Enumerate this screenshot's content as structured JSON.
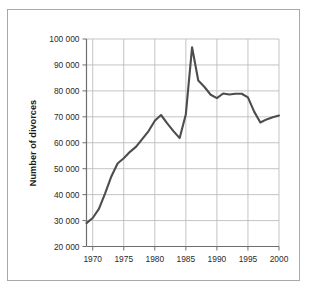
{
  "chart_data": {
    "type": "line",
    "title": "",
    "subtitle": "",
    "xlabel": "",
    "ylabel": "Number of divorces",
    "xlim": [
      1969,
      2000
    ],
    "ylim": [
      20000,
      100000
    ],
    "grid": true,
    "legend": null,
    "legend_position": "none",
    "line_color": "#4d4d4d",
    "grid_color": "#b9b9b9",
    "axis_color": "#6e6e6e",
    "frame_color": "#a8a8a8",
    "background_color": "#ffffff",
    "x_tick_labels": [
      "1970",
      "1975",
      "1980",
      "1985",
      "1990",
      "1995",
      "2000"
    ],
    "x_tick_values": [
      1970,
      1975,
      1980,
      1985,
      1990,
      1995,
      2000
    ],
    "y_tick_labels": [
      "20 000",
      "30 000",
      "40 000",
      "50 000",
      "60 000",
      "70 000",
      "80 000",
      "90 000",
      "100 000"
    ],
    "y_tick_values": [
      20000,
      30000,
      40000,
      50000,
      60000,
      70000,
      80000,
      90000,
      100000
    ],
    "series": [
      {
        "name": "Number of divorces",
        "x": [
          1969,
          1970,
          1971,
          1972,
          1973,
          1974,
          1975,
          1976,
          1977,
          1978,
          1979,
          1980,
          1981,
          1982,
          1983,
          1984,
          1985,
          1986,
          1987,
          1988,
          1989,
          1990,
          1991,
          1992,
          1993,
          1994,
          1995,
          1996,
          1997,
          1998,
          1999,
          2000
        ],
        "values": [
          29000,
          31000,
          34500,
          40500,
          47000,
          52000,
          54000,
          56500,
          58500,
          61500,
          64500,
          68500,
          70700,
          67500,
          64500,
          61800,
          71000,
          96800,
          84000,
          81500,
          78500,
          77200,
          79000,
          78600,
          78900,
          78900,
          77500,
          72000,
          67800,
          69000,
          69800,
          70500
        ]
      }
    ],
    "annotations": []
  }
}
